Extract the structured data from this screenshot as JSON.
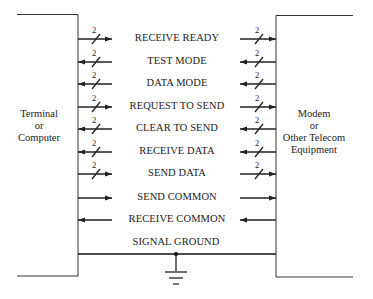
{
  "diagram": {
    "type": "interface-signal-diagram",
    "left_device": {
      "lines": [
        "Terminal",
        "or",
        "Computer"
      ]
    },
    "right_device": {
      "lines": [
        "Modem",
        "or",
        "Other Telecom",
        "Equipment"
      ]
    },
    "bus_width_label": "2",
    "signals": [
      {
        "label": "RECEIVE READY",
        "direction": "right",
        "bus": true,
        "y": 39
      },
      {
        "label": "TEST MODE",
        "direction": "left",
        "bus": true,
        "y": 62
      },
      {
        "label": "DATA MODE",
        "direction": "left",
        "bus": true,
        "y": 84
      },
      {
        "label": "REQUEST TO SEND",
        "direction": "right",
        "bus": true,
        "y": 107
      },
      {
        "label": "CLEAR TO SEND",
        "direction": "left",
        "bus": true,
        "y": 129
      },
      {
        "label": "RECEIVE DATA",
        "direction": "left",
        "bus": true,
        "y": 152
      },
      {
        "label": "SEND DATA",
        "direction": "right",
        "bus": true,
        "y": 174
      },
      {
        "label": "SEND COMMON",
        "direction": "right",
        "bus": false,
        "y": 198
      },
      {
        "label": "RECEIVE COMMON",
        "direction": "left",
        "bus": false,
        "y": 220
      }
    ],
    "ground": {
      "label": "SIGNAL GROUND",
      "icon": "ground-icon"
    },
    "colors": {
      "line": "#222222",
      "background": "#ffffff"
    }
  }
}
